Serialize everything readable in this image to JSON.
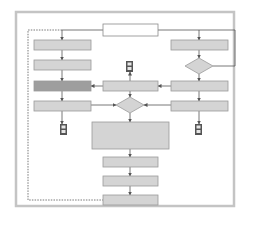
{
  "diagram": {
    "type": "flowchart",
    "width": 258,
    "height": 227,
    "colors": {
      "background": "#ffffff",
      "frame": "#c4c4c4",
      "box_fill": "#d4d4d4",
      "box_stroke": "#9a9a9a",
      "box_highlight_fill": "#9e9e9e",
      "start_fill": "#ffffff",
      "line": "#555555",
      "connector_fill": "#555555",
      "connector_inner": "#e6e6e6"
    },
    "frame": {
      "x": 16,
      "y": 12,
      "w": 218,
      "h": 194
    },
    "nodes": [
      {
        "id": "start",
        "shape": "rect",
        "style": "start",
        "x": 103,
        "y": 24,
        "w": 55,
        "h": 12,
        "label": ""
      },
      {
        "id": "L1",
        "shape": "rect",
        "style": "box",
        "x": 34,
        "y": 40,
        "w": 57,
        "h": 10,
        "label": ""
      },
      {
        "id": "L2",
        "shape": "rect",
        "style": "box",
        "x": 34,
        "y": 60,
        "w": 57,
        "h": 10,
        "label": ""
      },
      {
        "id": "L3",
        "shape": "rect",
        "style": "highlight",
        "x": 34,
        "y": 81,
        "w": 57,
        "h": 10,
        "label": ""
      },
      {
        "id": "L4",
        "shape": "rect",
        "style": "box",
        "x": 34,
        "y": 101,
        "w": 57,
        "h": 10,
        "label": ""
      },
      {
        "id": "R1",
        "shape": "rect",
        "style": "box",
        "x": 171,
        "y": 40,
        "w": 57,
        "h": 10,
        "label": ""
      },
      {
        "id": "RD",
        "shape": "diamond",
        "style": "box",
        "cx": 199,
        "cy": 66,
        "w": 28,
        "h": 16,
        "label": ""
      },
      {
        "id": "R2",
        "shape": "rect",
        "style": "box",
        "x": 171,
        "y": 81,
        "w": 57,
        "h": 10,
        "label": ""
      },
      {
        "id": "R3",
        "shape": "rect",
        "style": "box",
        "x": 171,
        "y": 101,
        "w": 57,
        "h": 10,
        "label": ""
      },
      {
        "id": "C1",
        "shape": "rect",
        "style": "box",
        "x": 103,
        "y": 81,
        "w": 55,
        "h": 10,
        "label": ""
      },
      {
        "id": "CD",
        "shape": "diamond",
        "style": "box",
        "cx": 130,
        "cy": 105,
        "w": 28,
        "h": 16,
        "label": ""
      },
      {
        "id": "BIG",
        "shape": "rect",
        "style": "box",
        "x": 92,
        "y": 122,
        "w": 77,
        "h": 27,
        "label": ""
      },
      {
        "id": "B1",
        "shape": "rect",
        "style": "box",
        "x": 103,
        "y": 157,
        "w": 55,
        "h": 10,
        "label": ""
      },
      {
        "id": "B2",
        "shape": "rect",
        "style": "box",
        "x": 103,
        "y": 176,
        "w": 55,
        "h": 10,
        "label": ""
      },
      {
        "id": "B3",
        "shape": "rect",
        "style": "box",
        "x": 103,
        "y": 195,
        "w": 55,
        "h": 10,
        "label": ""
      }
    ],
    "connectors": [
      {
        "id": "T1",
        "x": 126,
        "y": 61,
        "w": 7,
        "h": 11
      },
      {
        "id": "T2",
        "x": 60,
        "y": 124,
        "w": 7,
        "h": 11
      },
      {
        "id": "T3",
        "x": 195,
        "y": 124,
        "w": 7,
        "h": 11
      }
    ],
    "edges": [
      {
        "points": [
          [
            103,
            30
          ],
          [
            62,
            30
          ],
          [
            62,
            40
          ]
        ],
        "arrow": true,
        "dashed": false
      },
      {
        "points": [
          [
            62,
            30
          ],
          [
            28,
            30
          ],
          [
            28,
            200
          ],
          [
            103,
            200
          ]
        ],
        "arrow": false,
        "dashed": true
      },
      {
        "points": [
          [
            158,
            30
          ],
          [
            199,
            30
          ],
          [
            199,
            40
          ]
        ],
        "arrow": true,
        "dashed": false
      },
      {
        "points": [
          [
            199,
            30
          ],
          [
            235,
            30
          ],
          [
            235,
            66
          ],
          [
            213,
            66
          ]
        ],
        "arrow": false,
        "dashed": false
      },
      {
        "points": [
          [
            62,
            50
          ],
          [
            62,
            60
          ]
        ],
        "arrow": true,
        "dashed": false
      },
      {
        "points": [
          [
            62,
            70
          ],
          [
            62,
            81
          ]
        ],
        "arrow": true,
        "dashed": false
      },
      {
        "points": [
          [
            62,
            91
          ],
          [
            62,
            101
          ]
        ],
        "arrow": true,
        "dashed": false
      },
      {
        "points": [
          [
            62,
            111
          ],
          [
            62,
            124
          ]
        ],
        "arrow": true,
        "dashed": false
      },
      {
        "points": [
          [
            199,
            50
          ],
          [
            199,
            58
          ]
        ],
        "arrow": true,
        "dashed": false
      },
      {
        "points": [
          [
            199,
            74
          ],
          [
            199,
            81
          ]
        ],
        "arrow": true,
        "dashed": false
      },
      {
        "points": [
          [
            199,
            91
          ],
          [
            199,
            101
          ]
        ],
        "arrow": true,
        "dashed": false
      },
      {
        "points": [
          [
            199,
            111
          ],
          [
            199,
            124
          ]
        ],
        "arrow": true,
        "dashed": false
      },
      {
        "points": [
          [
            171,
            86
          ],
          [
            158,
            86
          ]
        ],
        "arrow": true,
        "dashed": false
      },
      {
        "points": [
          [
            103,
            86
          ],
          [
            91,
            86
          ]
        ],
        "arrow": true,
        "dashed": false
      },
      {
        "points": [
          [
            130,
            81
          ],
          [
            130,
            72
          ]
        ],
        "arrow": true,
        "dashed": false
      },
      {
        "points": [
          [
            130,
            91
          ],
          [
            130,
            97
          ]
        ],
        "arrow": true,
        "dashed": false
      },
      {
        "points": [
          [
            91,
            105
          ],
          [
            116,
            105
          ]
        ],
        "arrow": true,
        "dashed": false
      },
      {
        "points": [
          [
            171,
            105
          ],
          [
            144,
            105
          ]
        ],
        "arrow": true,
        "dashed": false
      },
      {
        "points": [
          [
            130,
            113
          ],
          [
            130,
            122
          ]
        ],
        "arrow": true,
        "dashed": false
      },
      {
        "points": [
          [
            130,
            149
          ],
          [
            130,
            157
          ]
        ],
        "arrow": true,
        "dashed": false
      },
      {
        "points": [
          [
            130,
            167
          ],
          [
            130,
            176
          ]
        ],
        "arrow": true,
        "dashed": false
      },
      {
        "points": [
          [
            130,
            186
          ],
          [
            130,
            195
          ]
        ],
        "arrow": true,
        "dashed": false
      }
    ]
  }
}
